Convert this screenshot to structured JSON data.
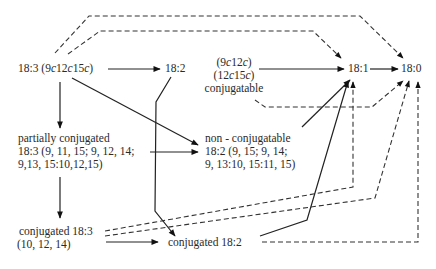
{
  "diagram": {
    "nodes": {
      "n183": {
        "label": "18:3 (9c12c15c)"
      },
      "n182": {
        "label": "18:2"
      },
      "conj_src": {
        "line1": "(9c12c)",
        "line2": "(12c15c)",
        "line3": "conjugatable"
      },
      "n181": {
        "label": "18:1"
      },
      "n180": {
        "label": "18:0"
      },
      "partial": {
        "line1": "partially conjugated",
        "line2": "18:3 (9, 11, 15; 9, 12, 14;",
        "line3": "9,13, 15:10,12,15)"
      },
      "nonconj": {
        "line1": "non - conjugatable",
        "line2": "18:2 (9, 15; 9, 14;",
        "line3": "9, 13:10, 15:11, 15)"
      },
      "conj183": {
        "line1": "conjugated 18:3",
        "line2": "(10, 12, 14)"
      },
      "conj182": {
        "label": "conjugated 18:2"
      }
    },
    "edges": [
      {
        "from": "18:3 (9c12c15c)",
        "to": "18:2",
        "style": "solid"
      },
      {
        "from": "18:3 (9c12c15c)",
        "to": "partially conjugated 18:3",
        "style": "solid"
      },
      {
        "from": "18:3 (9c12c15c)",
        "to": "non-conjugatable 18:2",
        "style": "solid"
      },
      {
        "from": "18:3 (9c12c15c)",
        "to": "18:1",
        "style": "dashed"
      },
      {
        "from": "18:3 (9c12c15c)",
        "to": "18:0",
        "style": "dashed"
      },
      {
        "from": "18:2",
        "to": "conjugated 18:2",
        "style": "solid"
      },
      {
        "from": "conjugatable (9c12c)(12c15c)",
        "to": "18:1",
        "style": "solid"
      },
      {
        "from": "conjugatable (9c12c)(12c15c)",
        "to": "18:0",
        "style": "dashed"
      },
      {
        "from": "18:1",
        "to": "18:0",
        "style": "solid"
      },
      {
        "from": "partially conjugated 18:3",
        "to": "non-conjugatable 18:2",
        "style": "solid"
      },
      {
        "from": "partially conjugated 18:3",
        "to": "conjugated 18:3",
        "style": "solid"
      },
      {
        "from": "non-conjugatable 18:2",
        "to": "18:1",
        "style": "solid"
      },
      {
        "from": "conjugated 18:3",
        "to": "conjugated 18:2",
        "style": "solid"
      },
      {
        "from": "conjugated 18:3",
        "to": "18:1",
        "style": "dashed"
      },
      {
        "from": "conjugated 18:3",
        "to": "18:0",
        "style": "dashed"
      },
      {
        "from": "conjugated 18:2",
        "to": "18:1",
        "style": "solid"
      },
      {
        "from": "conjugated 18:2",
        "to": "18:0",
        "style": "dashed"
      }
    ]
  }
}
